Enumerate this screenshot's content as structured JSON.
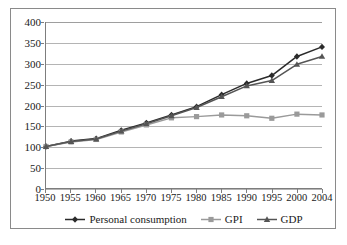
{
  "chart_data": {
    "type": "line",
    "title": "",
    "subtitle": "",
    "xlabel": "",
    "ylabel": "",
    "x": [
      1950,
      1955,
      1960,
      1965,
      1970,
      1975,
      1980,
      1985,
      1990,
      1995,
      2000,
      2004
    ],
    "categories": [
      "1950",
      "1955",
      "1960",
      "1965",
      "1970",
      "1975",
      "1980",
      "1985",
      "1990",
      "1995",
      "2000",
      "2004"
    ],
    "xtick_labels": [
      "1950",
      "1955",
      "1960",
      "1965",
      "1970",
      "1975",
      "1980",
      "1985",
      "1990",
      "1995",
      "2000",
      "2004"
    ],
    "ytick_labels": [
      "0",
      "50",
      "100",
      "150",
      "200",
      "250",
      "300",
      "350",
      "400"
    ],
    "yticks": [
      0,
      50,
      100,
      150,
      200,
      250,
      300,
      350,
      400
    ],
    "ylim": [
      0,
      400
    ],
    "xlim": [
      1950,
      2004
    ],
    "grid": "horizontal",
    "legend_position": "bottom",
    "series": [
      {
        "name": "Personal consumption",
        "color": "#2b2b2b",
        "marker": "diamond",
        "values": [
          100,
          113,
          119,
          139,
          157,
          176,
          196,
          225,
          252,
          271,
          317,
          340
        ]
      },
      {
        "name": "GPI",
        "color": "#9a9a9a",
        "marker": "square",
        "values": [
          100,
          111,
          117,
          135,
          152,
          169,
          172,
          176,
          174,
          168,
          178,
          176
        ]
      },
      {
        "name": "GDP",
        "color": "#555555",
        "marker": "triangle",
        "values": [
          100,
          112,
          118,
          137,
          155,
          174,
          194,
          220,
          246,
          259,
          298,
          317
        ]
      }
    ]
  },
  "legend": {
    "items": [
      {
        "label": "Personal consumption"
      },
      {
        "label": "GPI"
      },
      {
        "label": "GDP"
      }
    ]
  },
  "colors": {
    "axis": "#7d7d7d",
    "grid": "#b4b4b4",
    "frame": "#8a8a8a",
    "background": "#ffffff",
    "series_personal_consumption": "#2b2b2b",
    "series_gpi": "#9a9a9a",
    "series_gdp": "#555555"
  }
}
